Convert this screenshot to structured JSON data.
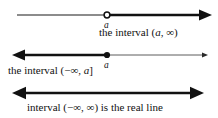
{
  "figure": {
    "background_color": "#ffffff",
    "ink_color": "#111111",
    "width": 218,
    "height": 118
  },
  "rows": [
    {
      "id": "row-open-interval",
      "endpoint_label": "a",
      "endpoint_style": "open-circle",
      "caption": "the interval (a, ∞)",
      "caption_parts": {
        "lead": "the interval (",
        "variable": "a",
        "tail": ", ∞)"
      },
      "ray_direction": "right",
      "axis_y": 15,
      "point_x": 107,
      "line_start_x": 17,
      "line_end_x": 210
    },
    {
      "id": "row-closed-interval",
      "endpoint_label": "a",
      "endpoint_style": "filled-dot",
      "caption": "the interval (−∞, a]",
      "caption_parts": {
        "lead": "the interval (−∞, ",
        "variable": "a",
        "tail": "]"
      },
      "ray_direction": "left",
      "axis_y": 55,
      "point_x": 107,
      "line_start_x": 14,
      "line_end_x": 207
    },
    {
      "id": "row-real-line",
      "endpoint_label": "",
      "endpoint_style": "none",
      "caption": "interval (−∞, ∞) is the real line",
      "caption_parts": {
        "lead": "interval (−∞, ∞) is the real line",
        "variable": "",
        "tail": ""
      },
      "ray_direction": "both",
      "axis_y": 93,
      "point_x": null,
      "line_start_x": 14,
      "line_end_x": 200
    }
  ],
  "symbols": {
    "infinity": "∞",
    "minus": "−",
    "open_paren": "(",
    "close_bracket": "]"
  }
}
